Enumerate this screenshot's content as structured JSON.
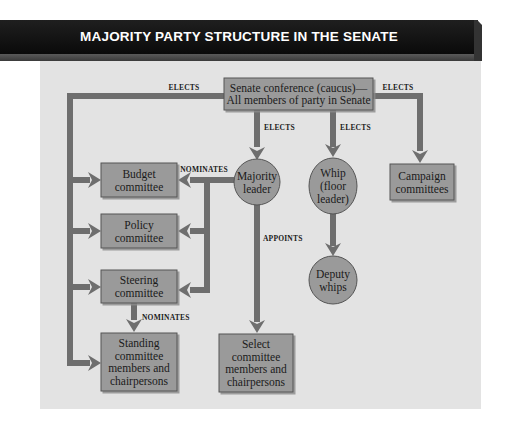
{
  "title": "MAJORITY PARTY STRUCTURE IN THE SENATE",
  "colors": {
    "banner": "#111111",
    "panel": "#e3e3e3",
    "node_fill": "#9a9a9a",
    "node_stroke": "#555555",
    "arrow": "#6e6e6e"
  },
  "nodes": {
    "conference": [
      "Senate conference (caucus)—",
      "All members of party in Senate"
    ],
    "majority_leader": [
      "Majority",
      "leader"
    ],
    "whip": [
      "Whip",
      "(floor",
      "leader)"
    ],
    "deputy_whips": [
      "Deputy",
      "whips"
    ],
    "campaign": [
      "Campaign",
      "committees"
    ],
    "budget": [
      "Budget",
      "committee"
    ],
    "policy": [
      "Policy",
      "committee"
    ],
    "steering": [
      "Steering",
      "committee"
    ],
    "standing": [
      "Standing",
      "committee",
      "members and",
      "chairpersons"
    ],
    "select": [
      "Select",
      "committee",
      "members and",
      "chairpersons"
    ]
  },
  "labels": {
    "elects_left": "ELECTS",
    "elects_right": "ELECTS",
    "elects_leader": "ELECTS",
    "elects_whip": "ELECTS",
    "nominates_leader": "NOMINATES",
    "nominates_steering": "NOMINATES",
    "appoints": "APPOINTS"
  }
}
